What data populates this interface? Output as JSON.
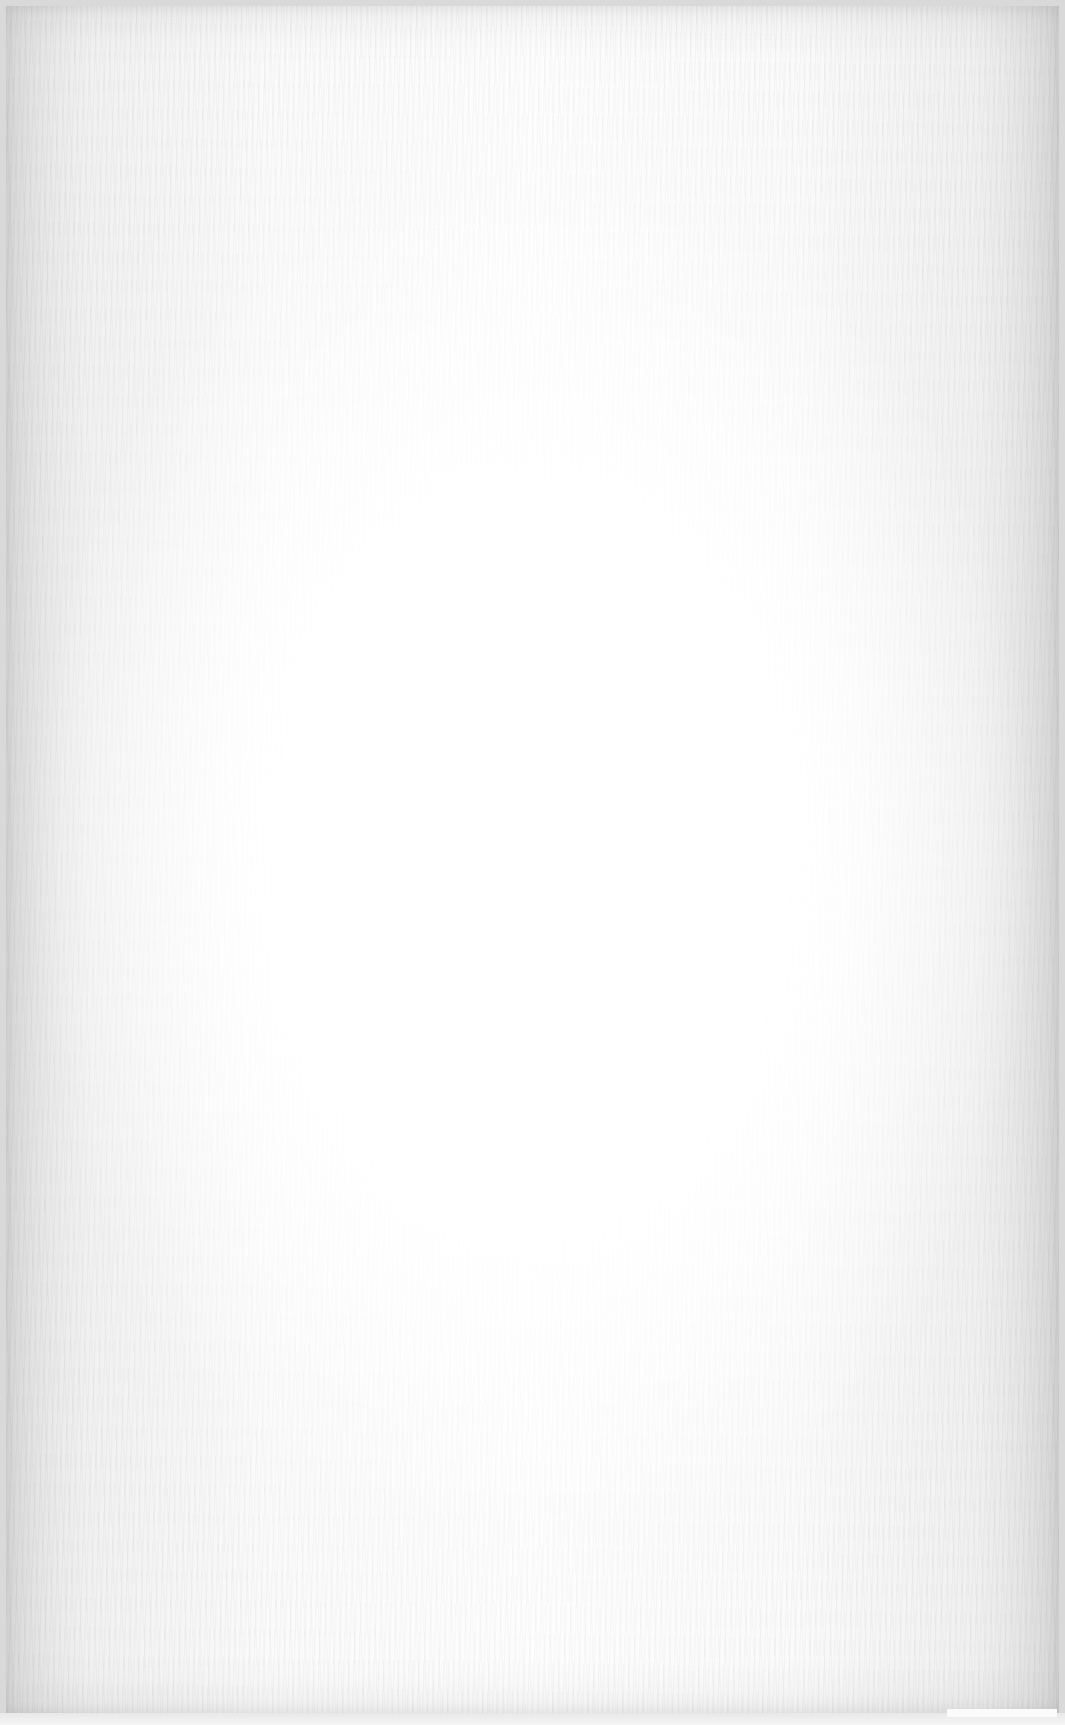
{
  "surface": {
    "description": "Blank textured paper sheet",
    "text_content": "",
    "colors": {
      "center": "#ffffff",
      "edge": "#e0e0e0",
      "frame": "#d9d9d9"
    }
  }
}
